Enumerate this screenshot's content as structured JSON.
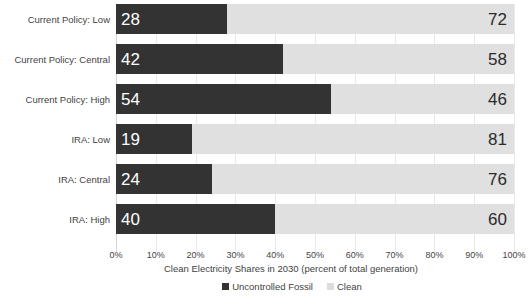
{
  "chart_data": {
    "type": "bar",
    "subtype": "stacked-horizontal-100-percent",
    "orientation": "horizontal",
    "title": "",
    "xlabel": "Clean Electricity Shares in 2030 (percent of total generation)",
    "ylabel": "",
    "xlim": [
      0,
      100
    ],
    "xticks": [
      "0%",
      "10%",
      "20%",
      "30%",
      "40%",
      "50%",
      "60%",
      "70%",
      "80%",
      "90%",
      "100%"
    ],
    "xtick_values": [
      0,
      10,
      20,
      30,
      40,
      50,
      60,
      70,
      80,
      90,
      100
    ],
    "grid": true,
    "grid_axis": "x",
    "legend_position": "bottom",
    "categories": [
      "Current Policy: Low",
      "Current Policy: Central",
      "Current Policy: High",
      "IRA: Low",
      "IRA: Central",
      "IRA: High"
    ],
    "series": [
      {
        "name": "Uncontrolled Fossil",
        "color": "#333333",
        "values": [
          28,
          42,
          54,
          19,
          24,
          40
        ]
      },
      {
        "name": "Clean",
        "color": "#e0e0e0",
        "values": [
          72,
          58,
          46,
          81,
          76,
          60
        ]
      }
    ]
  },
  "colors": {
    "fossil": "#333333",
    "clean": "#e0e0e0",
    "gridline": "#e9e9e9",
    "background": "#ffffff",
    "text": "#3f3f3f"
  }
}
